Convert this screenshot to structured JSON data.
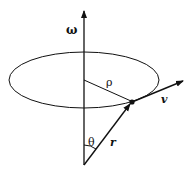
{
  "diagram": {
    "colors": {
      "stroke": "#111111",
      "background": "#ffffff"
    },
    "labels": {
      "omega": "ω",
      "rho": "ρ",
      "v": "v",
      "r": "r",
      "theta": "θ"
    },
    "elements": [
      {
        "id": "axis",
        "type": "arrow",
        "from": [
          84,
          165
        ],
        "to": [
          84,
          10
        ],
        "label": "ω"
      },
      {
        "id": "orbit",
        "type": "ellipse",
        "center": [
          84,
          80
        ],
        "rx": 75,
        "ry": 28
      },
      {
        "id": "rho-line",
        "type": "line",
        "from": [
          84,
          80
        ],
        "to": [
          132,
          102
        ],
        "label": "ρ"
      },
      {
        "id": "position-vector",
        "type": "arrow",
        "from": [
          84,
          165
        ],
        "to": [
          132,
          102
        ],
        "label": "r"
      },
      {
        "id": "velocity-vector",
        "type": "arrow",
        "from": [
          132,
          102
        ],
        "to": [
          184,
          81
        ],
        "label": "v"
      },
      {
        "id": "particle",
        "type": "point",
        "at": [
          132,
          102
        ]
      },
      {
        "id": "angle",
        "type": "arc",
        "vertex": [
          84,
          165
        ],
        "label": "θ"
      }
    ]
  }
}
